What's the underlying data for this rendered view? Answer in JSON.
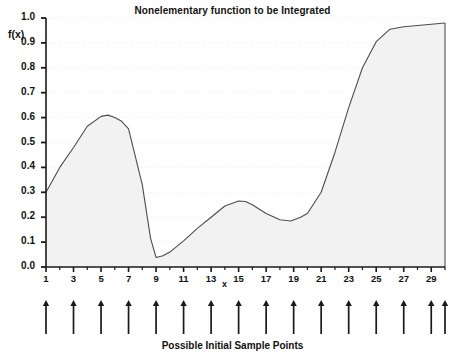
{
  "chart_data": {
    "type": "area",
    "title": "Nonelementary function to be Integrated",
    "xlabel": "x",
    "ylabel": "f(x)",
    "caption": "Possible Initial Sample Points",
    "xlim": [
      1,
      30
    ],
    "ylim": [
      0.0,
      1.0
    ],
    "grid": true,
    "legend": "none",
    "y_ticks": [
      "1.0",
      "0.9",
      "0.8",
      "0.7",
      "0.6",
      "0.5",
      "0.4",
      "0.3",
      "0.2",
      "0.1",
      "0.0"
    ],
    "y_tick_values": [
      1.0,
      0.9,
      0.8,
      0.7,
      0.6,
      0.5,
      0.4,
      0.3,
      0.2,
      0.1,
      0.0
    ],
    "x_ticks": [
      "1",
      "3",
      "5",
      "7",
      "9",
      "11",
      "13",
      "15",
      "17",
      "19",
      "21",
      "23",
      "25",
      "27",
      "29"
    ],
    "x_tick_values": [
      1,
      3,
      5,
      7,
      9,
      11,
      13,
      15,
      17,
      19,
      21,
      23,
      25,
      27,
      29
    ],
    "x_minor_tick_values": [
      2,
      4,
      6,
      8,
      10,
      12,
      14,
      16,
      18,
      20,
      22,
      24,
      26,
      28,
      30
    ],
    "x": [
      1,
      2,
      3,
      4,
      5,
      5.5,
      6,
      6.5,
      7,
      8,
      8.6,
      9,
      9.5,
      10,
      11,
      12,
      13,
      14,
      15,
      15.5,
      16,
      17,
      18,
      18.8,
      19.5,
      20,
      21,
      22,
      23,
      24,
      25,
      26,
      27,
      28,
      29,
      30
    ],
    "values": [
      0.3,
      0.4,
      0.48,
      0.565,
      0.605,
      0.61,
      0.6,
      0.585,
      0.555,
      0.33,
      0.115,
      0.038,
      0.045,
      0.06,
      0.105,
      0.155,
      0.2,
      0.245,
      0.265,
      0.263,
      0.25,
      0.215,
      0.19,
      0.185,
      0.2,
      0.215,
      0.3,
      0.46,
      0.64,
      0.8,
      0.905,
      0.955,
      0.965,
      0.97,
      0.975,
      0.98
    ],
    "series_name": "f(x)",
    "curve_color": "#4d4d4d",
    "fill_color": "#f2f2f2",
    "grid_color": "#e8e8e8",
    "axis_color": "#1a1a1a",
    "sample_points": [
      1,
      3,
      5,
      7,
      9,
      11,
      13,
      15,
      17,
      19,
      21,
      23,
      25,
      27,
      29,
      31
    ],
    "sample_point_count": 16,
    "sample_marker": "up-arrow"
  }
}
